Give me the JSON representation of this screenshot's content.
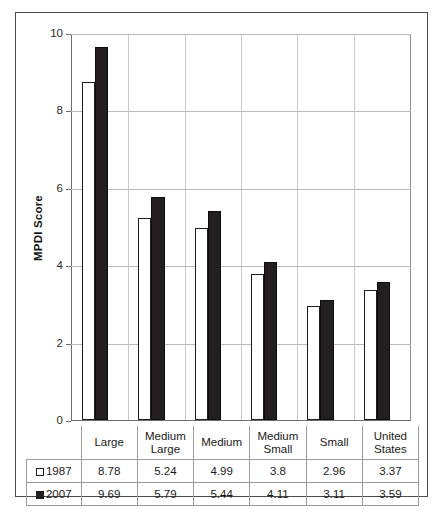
{
  "chart_data": {
    "type": "bar",
    "title": "",
    "xlabel": "",
    "ylabel": "MPDI Score",
    "ylim": [
      0,
      10
    ],
    "yticks": [
      0,
      2,
      4,
      6,
      8,
      10
    ],
    "grid": true,
    "legend_position": "table-row-labels",
    "categories": [
      "Large",
      "Medium Large",
      "Medium",
      "Medium Small",
      "Small",
      "United States"
    ],
    "category_lines": [
      [
        "Large"
      ],
      [
        "Medium",
        "Large"
      ],
      [
        "Medium"
      ],
      [
        "Medium",
        "Small"
      ],
      [
        "Small"
      ],
      [
        "United",
        "States"
      ]
    ],
    "series": [
      {
        "name": "1987",
        "color": "#ffffff",
        "values": [
          8.78,
          5.24,
          4.99,
          3.8,
          2.96,
          3.37
        ],
        "labels": [
          "8.78",
          "5.24",
          "4.99",
          "3.8",
          "2.96",
          "3.37"
        ]
      },
      {
        "name": "2007",
        "color": "#231f20",
        "values": [
          9.69,
          5.79,
          5.44,
          4.11,
          3.11,
          3.59
        ],
        "labels": [
          "9.69",
          "5.79",
          "5.44",
          "4.11",
          "3.11",
          "3.59"
        ]
      }
    ]
  },
  "table": {
    "corner_label": "",
    "row_labels": [
      "1987",
      "2007"
    ]
  }
}
